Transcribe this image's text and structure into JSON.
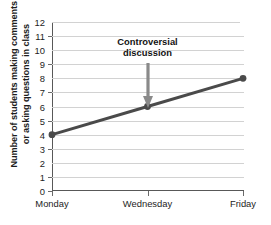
{
  "chart_data": {
    "type": "line",
    "title": "",
    "xlabel": "",
    "ylabel": "Number of students making comments or asking questions in class",
    "ylabel_line1": "Number of students making comments",
    "ylabel_line2": "or asking questions in class",
    "categories": [
      "Monday",
      "Wednesday",
      "Friday"
    ],
    "values": [
      4,
      6,
      8
    ],
    "series": [
      {
        "name": "Students participating",
        "values": [
          4,
          6,
          8
        ]
      }
    ],
    "ylim": [
      0,
      12
    ],
    "ytick_labels": [
      "0",
      "1",
      "2",
      "3",
      "4",
      "5",
      "6",
      "7",
      "8",
      "9",
      "10",
      "11",
      "12"
    ],
    "ytick_values": [
      0,
      1,
      2,
      3,
      4,
      5,
      6,
      7,
      8,
      9,
      10,
      11,
      12
    ],
    "grid": true,
    "grid_axis": "y",
    "legend": false,
    "legend_position": "none",
    "line_color": "#4a4a4a",
    "marker_color": "#4a4a4a",
    "grid_color": "#d2d2d2",
    "axis_color": "#585858",
    "annotations": [
      {
        "text_line1": "Controversial",
        "text_line2": "discussion",
        "text": "Controversial discussion",
        "points_to_category": "Wednesday",
        "points_to_value": 6,
        "arrow_color": "#8a8a8a"
      }
    ]
  }
}
